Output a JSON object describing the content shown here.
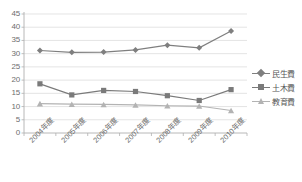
{
  "chart_data": {
    "type": "line",
    "title": "",
    "xlabel": "",
    "ylabel": "",
    "ylim": [
      0,
      45
    ],
    "ytick_step": 5,
    "yticks": [
      "0",
      "5",
      "10",
      "15",
      "20",
      "25",
      "30",
      "35",
      "40",
      "45"
    ],
    "grid": true,
    "legend_position": "right",
    "categories": [
      "2004年度",
      "2005年度",
      "2006年度",
      "2007年度",
      "2008年度",
      "2009年度",
      "2010年度"
    ],
    "series": [
      {
        "name": "民生費",
        "marker": "diamond",
        "color": "#7f7f7f",
        "values": [
          31.2,
          30.5,
          30.6,
          31.4,
          33.2,
          32.2,
          38.6
        ]
      },
      {
        "name": "土木費",
        "marker": "square",
        "color": "#7a7a7a",
        "values": [
          18.6,
          14.4,
          16.1,
          15.7,
          14.1,
          12.3,
          16.4
        ]
      },
      {
        "name": "教育費",
        "marker": "triangle",
        "color": "#b3b3b3",
        "values": [
          11.1,
          10.9,
          10.8,
          10.6,
          10.3,
          10.2,
          8.5
        ]
      }
    ]
  },
  "axis": {
    "axis_line_color": "#b0b0b0",
    "gridline_color": "#d9d9d9",
    "tick_text_color": "#6d6d6d"
  },
  "legend": {
    "entries": [
      {
        "label": "民生費"
      },
      {
        "label": "土木費"
      },
      {
        "label": "教育費"
      }
    ]
  }
}
